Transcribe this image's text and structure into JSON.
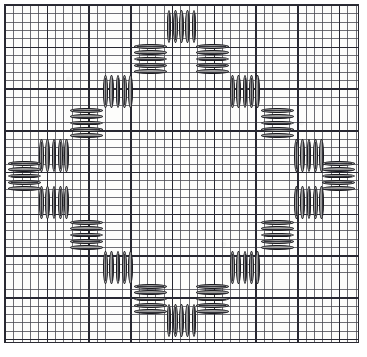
{
  "document": {
    "kind": "needlework-stitch-chart",
    "title": "Satin stitch diamond chart on graph paper",
    "description": "Square sheet of graph paper showing a closed octagonal / diamond ring built from alternating horizontal and vertical satin-stitch blocks stepped around the centre."
  },
  "canvas": {
    "width": 367,
    "height": 357,
    "background_color": "#ffffff"
  },
  "graph_paper": {
    "left": 5,
    "top": 5,
    "width": 353,
    "height": 337,
    "paper_color": "#fdfdfb",
    "minor_line_color": "#46464e",
    "major_line_color": "#282832",
    "border_color": "#2b2b33",
    "minor_cell_px": 8.35,
    "major_cell_px": 41.75,
    "minor_columns": 42,
    "minor_rows": 40,
    "major_columns": 8,
    "major_rows": 8
  },
  "stitch_style": {
    "fill_color": "#9b9b9b",
    "outline_color": "#1c1c20",
    "seam_color": "#22222a",
    "bar_outline_px": 1.1
  },
  "chart_data": {
    "type": "diagram",
    "symmetry": "4-fold (horizontal, vertical and diagonal mirror)",
    "motif": "stepped octagonal ring of satin-stitch blocks",
    "block_count": 20,
    "legend": [
      {
        "key": "block-h",
        "label": "Horizontal satin block (stacked wide bars)"
      },
      {
        "key": "block-v",
        "label": "Vertical satin block (side-by-side tall bars)"
      }
    ],
    "blocks": [
      {
        "name": "top-centre-vertical",
        "orient": "v",
        "x": 166,
        "y": 10,
        "w": 31,
        "h": 33,
        "bars": 5
      },
      {
        "name": "top-left-horizontal",
        "orient": "h",
        "x": 134,
        "y": 43,
        "w": 33,
        "h": 32,
        "bars": 5
      },
      {
        "name": "top-right-horizontal",
        "orient": "h",
        "x": 196,
        "y": 43,
        "w": 33,
        "h": 32,
        "bars": 5
      },
      {
        "name": "upper-left-vertical",
        "orient": "v",
        "x": 102,
        "y": 75,
        "w": 32,
        "h": 33,
        "bars": 5
      },
      {
        "name": "upper-right-vertical",
        "orient": "v",
        "x": 229,
        "y": 75,
        "w": 32,
        "h": 33,
        "bars": 5
      },
      {
        "name": "upper-left-horizontal",
        "orient": "h",
        "x": 70,
        "y": 107,
        "w": 33,
        "h": 32,
        "bars": 5
      },
      {
        "name": "upper-right-horizontal",
        "orient": "h",
        "x": 261,
        "y": 107,
        "w": 33,
        "h": 32,
        "bars": 5
      },
      {
        "name": "left-upper-vertical",
        "orient": "v",
        "x": 38,
        "y": 139,
        "w": 32,
        "h": 33,
        "bars": 5
      },
      {
        "name": "right-upper-vertical",
        "orient": "v",
        "x": 293,
        "y": 139,
        "w": 32,
        "h": 33,
        "bars": 5
      },
      {
        "name": "left-centre-horizontal",
        "orient": "h",
        "x": 8,
        "y": 160,
        "w": 33,
        "h": 32,
        "bars": 5
      },
      {
        "name": "right-centre-horizontal",
        "orient": "h",
        "x": 322,
        "y": 160,
        "w": 33,
        "h": 32,
        "bars": 5
      },
      {
        "name": "left-lower-vertical",
        "orient": "v",
        "x": 38,
        "y": 186,
        "w": 32,
        "h": 33,
        "bars": 5
      },
      {
        "name": "right-lower-vertical",
        "orient": "v",
        "x": 293,
        "y": 186,
        "w": 32,
        "h": 33,
        "bars": 5
      },
      {
        "name": "lower-left-horizontal",
        "orient": "h",
        "x": 70,
        "y": 219,
        "w": 33,
        "h": 32,
        "bars": 5
      },
      {
        "name": "lower-right-horizontal",
        "orient": "h",
        "x": 261,
        "y": 219,
        "w": 33,
        "h": 32,
        "bars": 5
      },
      {
        "name": "lower-left-vertical",
        "orient": "v",
        "x": 102,
        "y": 251,
        "w": 32,
        "h": 33,
        "bars": 5
      },
      {
        "name": "lower-right-vertical",
        "orient": "v",
        "x": 229,
        "y": 251,
        "w": 32,
        "h": 33,
        "bars": 5
      },
      {
        "name": "bottom-left-horizontal",
        "orient": "h",
        "x": 134,
        "y": 283,
        "w": 33,
        "h": 32,
        "bars": 5
      },
      {
        "name": "bottom-right-horizontal",
        "orient": "h",
        "x": 196,
        "y": 283,
        "w": 33,
        "h": 32,
        "bars": 5
      },
      {
        "name": "bottom-centre-vertical",
        "orient": "v",
        "x": 166,
        "y": 304,
        "w": 31,
        "h": 33,
        "bars": 5
      }
    ]
  }
}
